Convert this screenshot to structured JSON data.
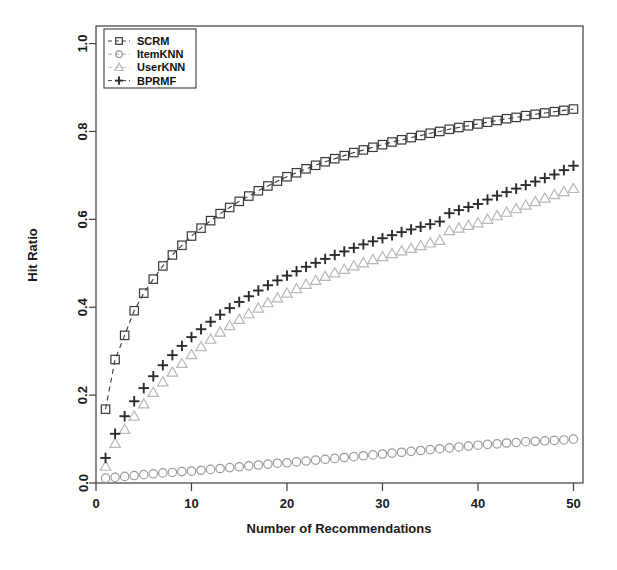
{
  "chart_data": {
    "type": "line",
    "title": "",
    "xlabel": "Number of Recommendations",
    "ylabel": "Hit Ratio",
    "xlim": [
      0,
      51
    ],
    "ylim": [
      0.0,
      1.04
    ],
    "xticks": [
      0,
      10,
      20,
      30,
      40,
      50
    ],
    "xtick_labels": [
      "0",
      "10",
      "20",
      "30",
      "40",
      "50"
    ],
    "yticks": [
      0.0,
      0.2,
      0.4,
      0.6,
      0.8,
      1.0
    ],
    "ytick_labels": [
      "0.0",
      "0.2",
      "0.4",
      "0.6",
      "0.8",
      "1.0"
    ],
    "grid": false,
    "legend_position": "top-left",
    "x": [
      1,
      2,
      3,
      4,
      5,
      6,
      7,
      8,
      9,
      10,
      11,
      12,
      13,
      14,
      15,
      16,
      17,
      18,
      19,
      20,
      21,
      22,
      23,
      24,
      25,
      26,
      27,
      28,
      29,
      30,
      31,
      32,
      33,
      34,
      35,
      36,
      37,
      38,
      39,
      40,
      41,
      42,
      43,
      44,
      45,
      46,
      47,
      48,
      49,
      50
    ],
    "series": [
      {
        "name": "SCRM",
        "marker": "square",
        "line": "dashed",
        "color": "#3a3a3a",
        "values": [
          0.168,
          0.281,
          0.336,
          0.392,
          0.432,
          0.464,
          0.494,
          0.519,
          0.541,
          0.562,
          0.58,
          0.597,
          0.613,
          0.627,
          0.641,
          0.653,
          0.665,
          0.676,
          0.687,
          0.697,
          0.706,
          0.715,
          0.723,
          0.731,
          0.738,
          0.745,
          0.752,
          0.758,
          0.764,
          0.77,
          0.776,
          0.781,
          0.786,
          0.791,
          0.796,
          0.8,
          0.805,
          0.809,
          0.813,
          0.817,
          0.821,
          0.825,
          0.829,
          0.832,
          0.836,
          0.839,
          0.842,
          0.845,
          0.848,
          0.851
        ]
      },
      {
        "name": "ItemKNN",
        "marker": "circle",
        "line": "none",
        "color": "#9a9a9a",
        "values": [
          0.011,
          0.013,
          0.015,
          0.017,
          0.019,
          0.021,
          0.023,
          0.024,
          0.026,
          0.027,
          0.029,
          0.031,
          0.033,
          0.035,
          0.037,
          0.039,
          0.041,
          0.043,
          0.045,
          0.046,
          0.048,
          0.05,
          0.052,
          0.054,
          0.056,
          0.058,
          0.06,
          0.062,
          0.064,
          0.066,
          0.068,
          0.07,
          0.072,
          0.074,
          0.076,
          0.078,
          0.08,
          0.082,
          0.084,
          0.086,
          0.088,
          0.089,
          0.091,
          0.092,
          0.094,
          0.095,
          0.096,
          0.097,
          0.098,
          0.1
        ]
      },
      {
        "name": "UserKNN",
        "marker": "triangle",
        "line": "none",
        "color": "#b8b8b8",
        "values": [
          0.038,
          0.09,
          0.122,
          0.152,
          0.18,
          0.206,
          0.23,
          0.252,
          0.272,
          0.292,
          0.31,
          0.327,
          0.343,
          0.358,
          0.372,
          0.385,
          0.398,
          0.41,
          0.421,
          0.432,
          0.442,
          0.452,
          0.461,
          0.47,
          0.478,
          0.486,
          0.494,
          0.501,
          0.508,
          0.515,
          0.522,
          0.528,
          0.534,
          0.54,
          0.546,
          0.552,
          0.574,
          0.58,
          0.586,
          0.592,
          0.6,
          0.608,
          0.616,
          0.624,
          0.632,
          0.64,
          0.648,
          0.656,
          0.663,
          0.67
        ]
      },
      {
        "name": "BPRMF",
        "marker": "plus",
        "line": "none",
        "color": "#2b2b2b",
        "values": [
          0.057,
          0.112,
          0.152,
          0.186,
          0.216,
          0.243,
          0.268,
          0.291,
          0.312,
          0.332,
          0.35,
          0.367,
          0.383,
          0.398,
          0.412,
          0.425,
          0.438,
          0.45,
          0.461,
          0.472,
          0.482,
          0.492,
          0.501,
          0.51,
          0.519,
          0.527,
          0.535,
          0.543,
          0.55,
          0.557,
          0.564,
          0.571,
          0.577,
          0.583,
          0.589,
          0.595,
          0.614,
          0.621,
          0.628,
          0.635,
          0.645,
          0.654,
          0.662,
          0.67,
          0.678,
          0.686,
          0.694,
          0.702,
          0.712,
          0.722
        ]
      }
    ]
  },
  "legend": {
    "entries": [
      {
        "label": "SCRM"
      },
      {
        "label": "ItemKNN"
      },
      {
        "label": "UserKNN"
      },
      {
        "label": "BPRMF"
      }
    ]
  }
}
